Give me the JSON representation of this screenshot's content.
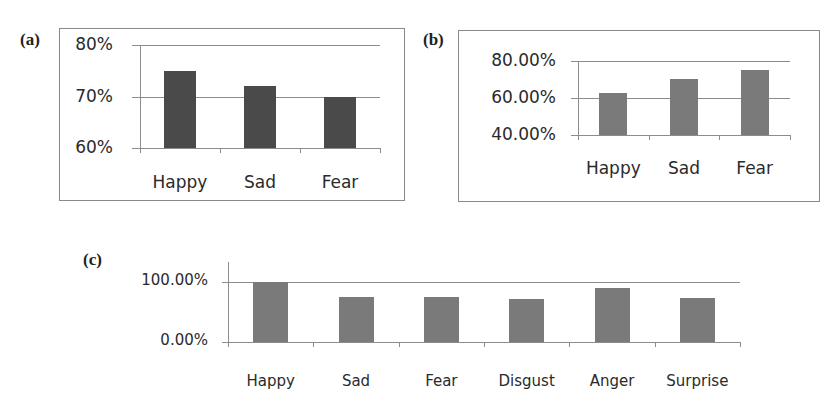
{
  "chart_data": [
    {
      "panel": "(a)",
      "type": "bar",
      "categories": [
        "Happy",
        "Sad",
        "Fear"
      ],
      "values": [
        75,
        72,
        70
      ],
      "ytick_labels": [
        "80%",
        "70%",
        "60%"
      ],
      "ylim": [
        60,
        80
      ],
      "grid": true,
      "bar_color": "#4a4a4a",
      "title": "",
      "xlabel": "",
      "ylabel": ""
    },
    {
      "panel": "(b)",
      "type": "bar",
      "categories": [
        "Happy",
        "Sad",
        "Fear"
      ],
      "values": [
        62.5,
        70,
        75
      ],
      "ytick_labels": [
        "80.00%",
        "60.00%",
        "40.00%"
      ],
      "ylim": [
        40,
        80
      ],
      "grid": true,
      "bar_color": "#7a7a7a",
      "title": "",
      "xlabel": "",
      "ylabel": ""
    },
    {
      "panel": "(c)",
      "type": "bar",
      "categories": [
        "Happy",
        "Sad",
        "Fear",
        "Disgust",
        "Anger",
        "Surprise"
      ],
      "values": [
        100,
        75,
        75,
        71,
        90,
        74
      ],
      "ytick_labels": [
        "100.00%",
        "0.00%"
      ],
      "ylim": [
        0,
        100
      ],
      "grid": true,
      "bar_color": "#7a7a7a",
      "title": "",
      "xlabel": "",
      "ylabel": ""
    }
  ]
}
